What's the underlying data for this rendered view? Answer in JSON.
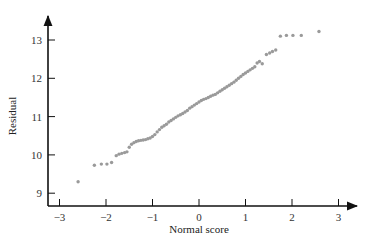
{
  "chart_data": {
    "type": "scatter",
    "title": "",
    "xlabel": "Normal score",
    "ylabel": "Residual",
    "xlim": [
      -3.2,
      3.4
    ],
    "ylim": [
      8.7,
      13.7
    ],
    "x_ticks": [
      -3,
      -2,
      -1,
      0,
      1,
      2,
      3
    ],
    "x_tick_labels": [
      "−3",
      "−2",
      "−1",
      "0",
      "1",
      "2",
      "3"
    ],
    "y_ticks": [
      9,
      10,
      11,
      12,
      13
    ],
    "y_tick_labels": [
      "9",
      "10",
      "11",
      "12",
      "13"
    ],
    "grid": false,
    "legend": null,
    "point_color": "#9a9a9a",
    "axis_color": "#111111",
    "points": [
      [
        -2.6,
        9.3
      ],
      [
        -2.25,
        9.73
      ],
      [
        -2.1,
        9.76
      ],
      [
        -1.98,
        9.76
      ],
      [
        -1.88,
        9.8
      ],
      [
        -1.78,
        9.98
      ],
      [
        -1.72,
        10.02
      ],
      [
        -1.66,
        10.04
      ],
      [
        -1.6,
        10.06
      ],
      [
        -1.55,
        10.08
      ],
      [
        -1.5,
        10.2
      ],
      [
        -1.45,
        10.28
      ],
      [
        -1.4,
        10.32
      ],
      [
        -1.35,
        10.35
      ],
      [
        -1.3,
        10.37
      ],
      [
        -1.25,
        10.38
      ],
      [
        -1.2,
        10.39
      ],
      [
        -1.15,
        10.4
      ],
      [
        -1.1,
        10.42
      ],
      [
        -1.05,
        10.44
      ],
      [
        -1.0,
        10.48
      ],
      [
        -0.95,
        10.53
      ],
      [
        -0.9,
        10.6
      ],
      [
        -0.85,
        10.66
      ],
      [
        -0.8,
        10.72
      ],
      [
        -0.75,
        10.76
      ],
      [
        -0.7,
        10.8
      ],
      [
        -0.65,
        10.86
      ],
      [
        -0.6,
        10.9
      ],
      [
        -0.55,
        10.94
      ],
      [
        -0.5,
        10.98
      ],
      [
        -0.45,
        11.02
      ],
      [
        -0.4,
        11.05
      ],
      [
        -0.35,
        11.08
      ],
      [
        -0.3,
        11.12
      ],
      [
        -0.25,
        11.16
      ],
      [
        -0.2,
        11.22
      ],
      [
        -0.15,
        11.26
      ],
      [
        -0.1,
        11.3
      ],
      [
        -0.05,
        11.34
      ],
      [
        0.0,
        11.38
      ],
      [
        0.05,
        11.42
      ],
      [
        0.1,
        11.45
      ],
      [
        0.15,
        11.47
      ],
      [
        0.2,
        11.5
      ],
      [
        0.25,
        11.53
      ],
      [
        0.3,
        11.56
      ],
      [
        0.35,
        11.58
      ],
      [
        0.4,
        11.62
      ],
      [
        0.45,
        11.66
      ],
      [
        0.5,
        11.7
      ],
      [
        0.55,
        11.74
      ],
      [
        0.6,
        11.78
      ],
      [
        0.65,
        11.82
      ],
      [
        0.7,
        11.86
      ],
      [
        0.75,
        11.9
      ],
      [
        0.8,
        11.95
      ],
      [
        0.85,
        12.0
      ],
      [
        0.9,
        12.05
      ],
      [
        0.95,
        12.1
      ],
      [
        1.0,
        12.14
      ],
      [
        1.05,
        12.18
      ],
      [
        1.1,
        12.22
      ],
      [
        1.15,
        12.26
      ],
      [
        1.2,
        12.3
      ],
      [
        1.25,
        12.4
      ],
      [
        1.3,
        12.44
      ],
      [
        1.36,
        12.38
      ],
      [
        1.45,
        12.62
      ],
      [
        1.52,
        12.66
      ],
      [
        1.58,
        12.7
      ],
      [
        1.65,
        12.74
      ],
      [
        1.75,
        13.1
      ],
      [
        1.88,
        13.12
      ],
      [
        2.02,
        13.12
      ],
      [
        2.2,
        13.12
      ],
      [
        2.58,
        13.22
      ]
    ]
  }
}
